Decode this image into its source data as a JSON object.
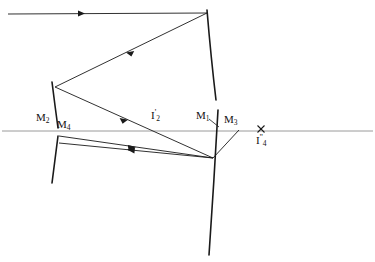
{
  "figure": {
    "type": "optical-ray-diagram",
    "background_color": "#ffffff",
    "ink_color": "#1a1a1a",
    "axis_color": "#9a9a9a",
    "width": 375,
    "height": 262
  },
  "labels": {
    "m2": {
      "base": "M",
      "sub": "2"
    },
    "m4": {
      "base": "M",
      "sub": "4"
    },
    "i2": {
      "base": "I",
      "sub": "2",
      "sup": "'"
    },
    "m1": {
      "base": "M",
      "sub": "1"
    },
    "m3": {
      "base": "M",
      "sub": "3"
    },
    "i4": {
      "base": "I",
      "sub": "4",
      "sup": "''"
    }
  },
  "elements": {
    "optical_axis": {
      "name": "optical-axis",
      "y": 131,
      "x_start": 2,
      "x_end": 373
    },
    "mirror_m1_upper": {
      "name": "mirror-m1-upper-arc",
      "path": "M 207 10 Q 211 58 216 100"
    },
    "mirror_m3_lower": {
      "name": "mirror-m3-lower-arc",
      "path": "M 218 110 Q 214 182 209 255"
    },
    "mirror_m2_upper": {
      "name": "mirror-m2-upper-arc",
      "path": "M 52 82 Q 55 106 58 128"
    },
    "mirror_m4_lower": {
      "name": "mirror-m4-lower-arc",
      "path": "M 58 136 Q 55 160 52 183"
    },
    "m1_leader": {
      "name": "m1-leader-line",
      "path": "M 209 119 L 219 127"
    },
    "cross_mark_i4": {
      "name": "image-point-cross-marker",
      "x": 261,
      "y": 129,
      "size": 4
    }
  },
  "rays": [
    {
      "name": "incoming-ray-top",
      "path": "M 8 14 L 207 13",
      "arrow_at": 0.42,
      "arrow_dir": "right"
    },
    {
      "name": "ray-m1-to-m2",
      "path": "M 207 13 L 55 87",
      "arrow_at": 0.52,
      "arrow_dir": "left"
    },
    {
      "name": "ray-m2-to-lower-mirror",
      "path": "M 55 87 L 213 158",
      "arrow_at": 0.46,
      "arrow_dir": "right"
    },
    {
      "name": "ray-lower-mirror-to-m4",
      "path": "M 213 158 L 59 143",
      "arrow_at": 0.56,
      "arrow_dir": "left"
    },
    {
      "name": "ray-m4-to-lower-mirror",
      "path": "M 59 136 L 213 158",
      "arrow_at": 0.5,
      "arrow_dir": "right"
    },
    {
      "name": "ray-lower-mirror-to-axis",
      "path": "M 213 158 L 238 131",
      "arrow_at": 0.6,
      "arrow_dir": "right"
    }
  ]
}
